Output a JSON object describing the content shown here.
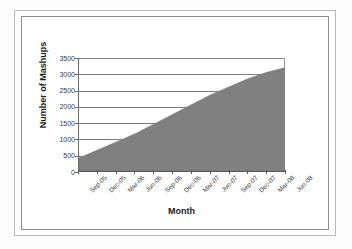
{
  "chart_data": {
    "type": "area",
    "title": "",
    "xlabel": "Month",
    "ylabel": "Number of Mashups",
    "ylim": [
      0,
      3500
    ],
    "yticks": [
      0,
      500,
      1000,
      1500,
      2000,
      2500,
      3000,
      3500
    ],
    "grid": true,
    "legend": "none",
    "series_color": "#808080",
    "categories": [
      "Sep-05",
      "Dec-05",
      "Mar-06",
      "Jun-06",
      "Sep-06",
      "Dec-06",
      "Mar-07",
      "Jun-07",
      "Sep-07",
      "Dec-07",
      "Mar-08",
      "Jun-08"
    ],
    "values": [
      400,
      650,
      900,
      1150,
      1450,
      1750,
      2050,
      2350,
      2600,
      2850,
      3050,
      3200
    ],
    "series": [
      {
        "name": "Number of Mashups",
        "values": [
          400,
          650,
          900,
          1150,
          1450,
          1750,
          2050,
          2350,
          2600,
          2850,
          3050,
          3200
        ]
      }
    ]
  }
}
